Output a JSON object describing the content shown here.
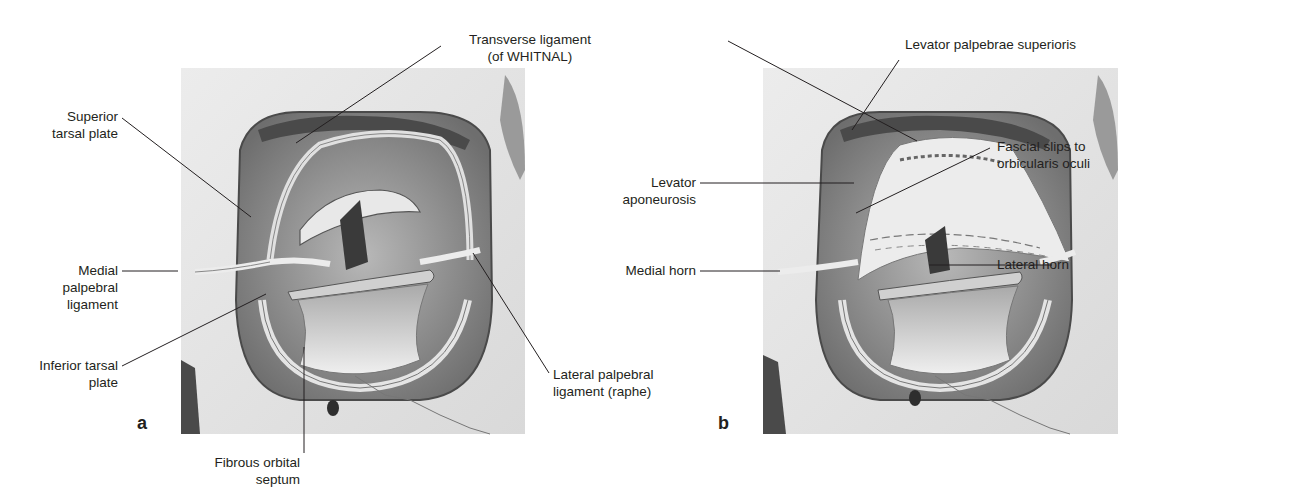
{
  "figure": {
    "panels": [
      {
        "letter": "a",
        "labels": {
          "superior_tarsal_plate": [
            "Superior",
            "tarsal plate"
          ],
          "medial_palpebral_ligament": [
            "Medial",
            "palpebral",
            "ligament"
          ],
          "inferior_tarsal_plate": [
            "Inferior tarsal",
            "plate"
          ],
          "fibrous_orbital_septum": [
            "Fibrous orbital",
            "septum"
          ],
          "lateral_palpebral_ligament": [
            "Lateral palpebral",
            "ligament (raphe)"
          ]
        }
      },
      {
        "letter": "b",
        "labels": {
          "levator_palpebrae_superioris": [
            "Levator palpebrae superioris"
          ],
          "levator_aponeurosis": [
            "Levator",
            "aponeurosis"
          ],
          "medial_horn": [
            "Medial horn"
          ],
          "fascial_slips": [
            "Fascial slips to",
            "orbicularis oculi"
          ],
          "lateral_horn": [
            "Lateral horn"
          ]
        }
      }
    ],
    "shared_labels": {
      "transverse_ligament": [
        "Transverse ligament",
        "(of WHITNAL)"
      ]
    },
    "colors": {
      "text": "#231f20",
      "leader": "#231f20",
      "bone": "#e6e6e6",
      "shadow": "#6a6a6a",
      "dark": "#3a3a3a"
    }
  }
}
